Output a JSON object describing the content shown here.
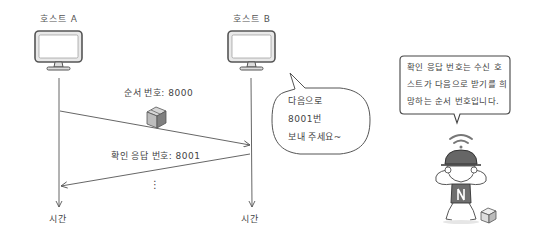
{
  "hosts": [
    {
      "id": "a",
      "title": "호스트 A",
      "time_label": "시간"
    },
    {
      "id": "b",
      "title": "호스트 B",
      "time_label": "시간"
    }
  ],
  "messages": {
    "seq": {
      "label": "순서 번호: 8000",
      "direction": "A→B"
    },
    "ack": {
      "label": "확인 응답 번호: 8001",
      "direction": "B→A"
    },
    "continuation": "⋮"
  },
  "speech_bubble": {
    "lines": [
      "다음으로",
      "8001번",
      "보내 주세요~"
    ]
  },
  "note": {
    "lines": [
      "확인 응답 번호는 수신 호",
      "스트가 다음으로 받기를 희",
      "망하는 순서 번호입니다."
    ]
  },
  "icons": [
    "monitor-icon",
    "package-box-icon",
    "wifi-signal-icon",
    "character-illustration"
  ],
  "colors": {
    "line": "#555555",
    "monitor_fill": "#e8e8e8",
    "cap": "#666666",
    "box_light": "#cfcfcf",
    "box_dark": "#8a8a8a"
  }
}
